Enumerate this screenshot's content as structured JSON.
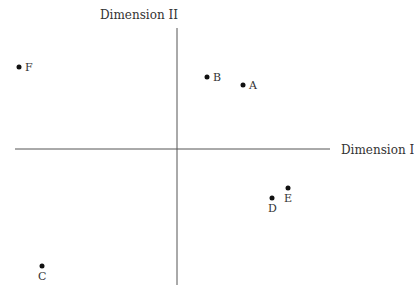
{
  "chart_data": {
    "type": "scatter",
    "title": "",
    "xlabel": "Dimension I",
    "ylabel": "Dimension II",
    "grid": false,
    "legend": null,
    "origin_px": [
      177,
      149
    ],
    "axes_px": {
      "x": [
        15,
        330
      ],
      "y": [
        28,
        285
      ]
    },
    "points": [
      {
        "label": "A",
        "x": 66,
        "y": 64,
        "px": [
          243,
          85
        ],
        "label_pos": "right"
      },
      {
        "label": "B",
        "x": 30,
        "y": 72,
        "px": [
          207,
          77
        ],
        "label_pos": "right"
      },
      {
        "label": "C",
        "x": -135,
        "y": -117,
        "px": [
          42,
          266
        ],
        "label_pos": "below"
      },
      {
        "label": "D",
        "x": 95,
        "y": -49,
        "px": [
          272,
          198
        ],
        "label_pos": "below"
      },
      {
        "label": "E",
        "x": 111,
        "y": -39,
        "px": [
          288,
          188
        ],
        "label_pos": "below"
      },
      {
        "label": "F",
        "x": -158,
        "y": 82,
        "px": [
          19,
          67
        ],
        "label_pos": "right"
      }
    ]
  },
  "axis_labels": {
    "x": "Dimension I",
    "y": "Dimension II"
  }
}
